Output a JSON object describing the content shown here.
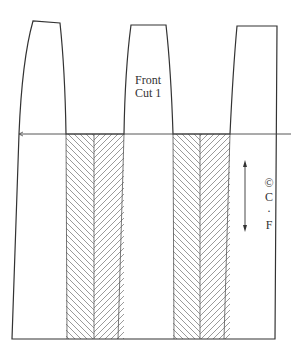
{
  "diagram": {
    "type": "sewing-pattern",
    "piece_label_line1": "Front",
    "piece_label_line2": "Cut 1",
    "centerline_symbol": "©",
    "cf_letter1": "C",
    "cf_dot": "·",
    "cf_letter2": "F",
    "colors": {
      "line": "#333333",
      "hatch": "#555555",
      "background": "#ffffff"
    }
  }
}
